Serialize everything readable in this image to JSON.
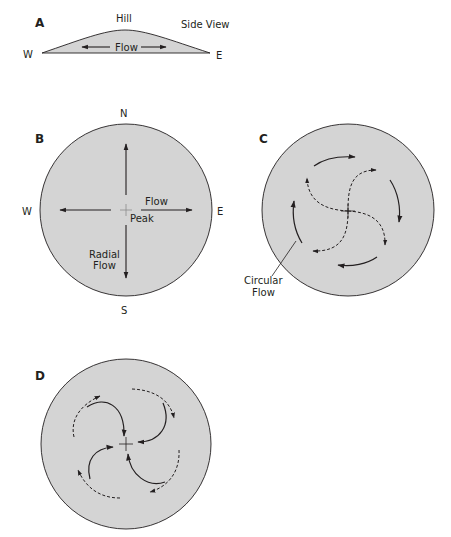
{
  "colors": {
    "fill": "#d4d4d4",
    "stroke": "#231f20",
    "background": "#ffffff"
  },
  "panelA": {
    "label": "A",
    "title": "Hill",
    "view": "Side View",
    "west": "W",
    "east": "E",
    "flow": "Flow"
  },
  "panelB": {
    "label": "B",
    "north": "N",
    "south": "S",
    "west": "W",
    "east": "E",
    "flow": "Flow",
    "peak": "Peak",
    "radial_line1": "Radial",
    "radial_line2": "Flow"
  },
  "panelC": {
    "label": "C",
    "circular_line1": "Circular",
    "circular_line2": "Flow"
  },
  "panelD": {
    "label": "D"
  }
}
